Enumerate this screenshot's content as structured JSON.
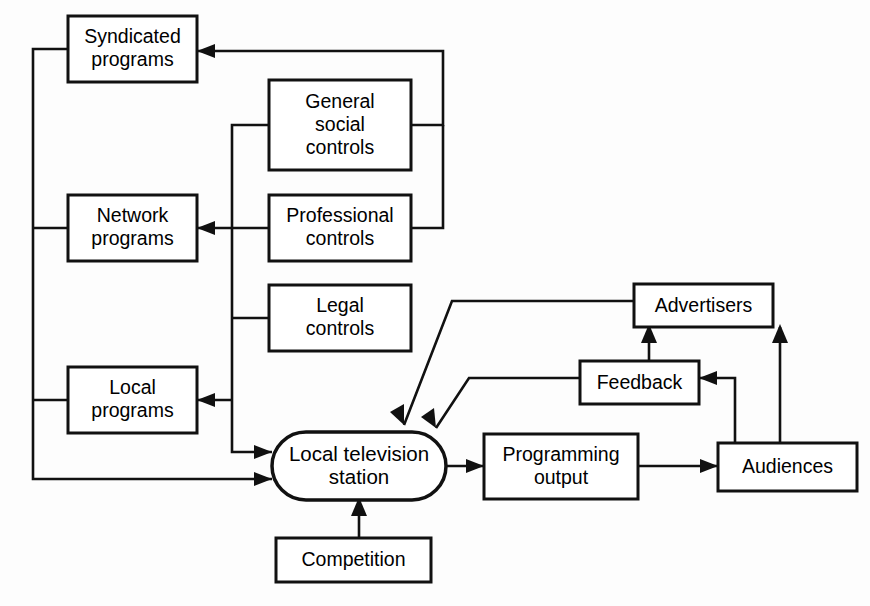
{
  "diagram": {
    "background_color": "#fdfdfd",
    "line_color": "#111111",
    "box_fill": "#ffffff",
    "nodes": [
      {
        "id": "syndicated-programs",
        "label_line1": "Syndicated",
        "label_line2": "programs",
        "shape": "rectangle"
      },
      {
        "id": "general-social-controls",
        "label_line1": "General",
        "label_line2": "social",
        "label_line3": "controls",
        "shape": "rectangle"
      },
      {
        "id": "network-programs",
        "label_line1": "Network",
        "label_line2": "programs",
        "shape": "rectangle"
      },
      {
        "id": "professional-controls",
        "label_line1": "Professional",
        "label_line2": "controls",
        "shape": "rectangle"
      },
      {
        "id": "legal-controls",
        "label_line1": "Legal",
        "label_line2": "controls",
        "shape": "rectangle"
      },
      {
        "id": "advertisers",
        "label_line1": "Advertisers",
        "shape": "rectangle"
      },
      {
        "id": "local-programs",
        "label_line1": "Local",
        "label_line2": "programs",
        "shape": "rectangle"
      },
      {
        "id": "feedback",
        "label_line1": "Feedback",
        "shape": "rectangle"
      },
      {
        "id": "local-television-station",
        "label_line1": "Local television",
        "label_line2": "station",
        "shape": "stadium"
      },
      {
        "id": "programming-output",
        "label_line1": "Programming",
        "label_line2": "output",
        "shape": "rectangle"
      },
      {
        "id": "audiences",
        "label_line1": "Audiences",
        "shape": "rectangle"
      },
      {
        "id": "competition",
        "label_line1": "Competition",
        "shape": "rectangle"
      }
    ],
    "edges": [
      {
        "id": "general-social-to-syndicated",
        "from": "general-social-controls",
        "to": "syndicated-programs"
      },
      {
        "id": "professional-to-network",
        "from": "professional-controls",
        "to": "network-programs"
      },
      {
        "id": "controls-bus-to-local-programs",
        "from": "legal-controls",
        "to": "local-programs"
      },
      {
        "id": "controls-bus-to-station",
        "from": "legal-controls",
        "to": "local-television-station"
      },
      {
        "id": "programs-bus-to-station",
        "from": "syndicated-programs",
        "to": "local-television-station"
      },
      {
        "id": "advertisers-to-station",
        "from": "advertisers",
        "to": "local-television-station"
      },
      {
        "id": "feedback-to-station",
        "from": "feedback",
        "to": "local-television-station"
      },
      {
        "id": "competition-to-station",
        "from": "competition",
        "to": "local-television-station"
      },
      {
        "id": "station-to-programming-output",
        "from": "local-television-station",
        "to": "programming-output"
      },
      {
        "id": "programming-output-to-audiences",
        "from": "programming-output",
        "to": "audiences"
      },
      {
        "id": "audiences-to-feedback",
        "from": "audiences",
        "to": "feedback"
      },
      {
        "id": "audiences-to-advertisers",
        "from": "audiences",
        "to": "advertisers"
      },
      {
        "id": "feedback-to-advertisers",
        "from": "feedback",
        "to": "advertisers"
      }
    ]
  }
}
